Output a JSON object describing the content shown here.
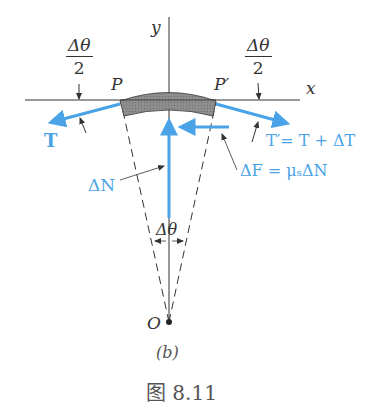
{
  "diagram": {
    "axes": {
      "x_label": "x",
      "y_label": "y"
    },
    "points": {
      "P": "P",
      "P_prime": "P′",
      "O": "O"
    },
    "angles": {
      "half_left": {
        "num": "Δθ",
        "den": "2"
      },
      "half_right": {
        "num": "Δθ",
        "den": "2"
      },
      "full": "Δθ"
    },
    "forces": {
      "T": "T",
      "T_prime": "T′= T + ΔT",
      "delta_N": "ΔN",
      "delta_F": "ΔF = μₛΔN"
    },
    "subfigure_label": "(b)",
    "caption_partial": "图 8.11",
    "colors": {
      "force": "#4aa3e6",
      "line": "#333333",
      "belt_fill": "#8a8a8a"
    }
  }
}
